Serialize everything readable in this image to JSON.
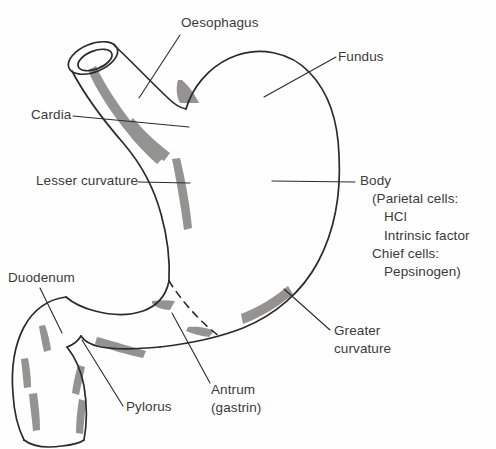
{
  "figure": {
    "colors": {
      "outline": "#2b2b2b",
      "rugae_shading": "#8d8b88",
      "text": "#3a3a3a",
      "leader_line": "#2b2b2b",
      "background": "#fefefe"
    }
  },
  "labels": {
    "oesophagus": "Oesophagus",
    "fundus": "Fundus",
    "cardia": "Cardia",
    "lesser_curvature": "Lesser curvature",
    "body": "Body",
    "body_detail": {
      "line1": "(Parietal cells:",
      "line2": "HCl",
      "line3": "Intrinsic factor",
      "line4": "Chief cells:",
      "line5": "Pepsinogen)"
    },
    "greater_curvature_line1": "Greater",
    "greater_curvature_line2": "curvature",
    "duodenum": "Duodenum",
    "pylorus": "Pylorus",
    "antrum_line1": "Antrum",
    "antrum_line2": "(gastrin)"
  },
  "parts": [
    "oesophagus",
    "cardia",
    "fundus",
    "body",
    "lesser curvature",
    "greater curvature",
    "antrum",
    "pylorus",
    "duodenum"
  ]
}
